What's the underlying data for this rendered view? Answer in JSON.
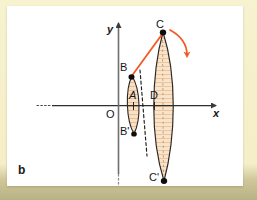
{
  "figure": {
    "panel_label": "b",
    "background_color": "#f4efc8",
    "card_color": "#ffffff",
    "accent_color": "#ef5a28",
    "fill_color": "#f6dcc0",
    "outline_color": "#2b2420"
  },
  "axes": {
    "x_label": "x",
    "y_label": "y",
    "origin_label": "O",
    "x_axis_name": "horizontal-axis",
    "y_axis_name": "vertical-axis"
  },
  "points": [
    {
      "id": "C",
      "label": "C",
      "x": 156,
      "y": 26,
      "marker": true
    },
    {
      "id": "B",
      "label": "B",
      "x": 125,
      "y": 70,
      "marker": true
    },
    {
      "id": "A",
      "label": "A",
      "x": 126,
      "y": 96,
      "marker": false
    },
    {
      "id": "D",
      "label": "D",
      "x": 147,
      "y": 96,
      "marker": false
    },
    {
      "id": "Bp",
      "label": "B'",
      "x": 127,
      "y": 128,
      "marker": true
    },
    {
      "id": "Cp",
      "label": "C'",
      "x": 157,
      "y": 175,
      "marker": true
    }
  ],
  "shapes": {
    "small_lens": {
      "name": "small-lens-ellipse",
      "cx": 126,
      "cy": 99,
      "rx": 7,
      "ry": 30
    },
    "large_lens": {
      "name": "large-lens-ellipse",
      "cx": 155,
      "cy": 100,
      "rx": 11,
      "ry": 75
    }
  },
  "annotations": {
    "chord_BC": "chord-b-to-c",
    "rotation_arrow": "rotation-arrow",
    "dashed_axis_small": "dashed-center-line-small",
    "dashed_axis_large": "dashed-center-line-large"
  }
}
